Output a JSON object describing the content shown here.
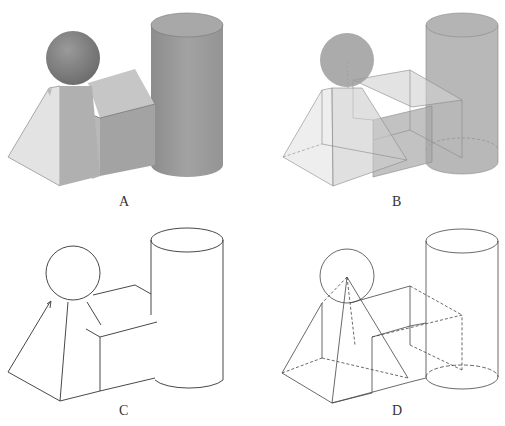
{
  "figure": {
    "panels": [
      {
        "id": "A",
        "label": "A",
        "mode": "shaded",
        "x": 0,
        "y": 0
      },
      {
        "id": "B",
        "label": "B",
        "mode": "transparent",
        "x": 250,
        "y": 0
      },
      {
        "id": "C",
        "label": "C",
        "mode": "hidden-line",
        "x": 0,
        "y": 215
      },
      {
        "id": "D",
        "label": "D",
        "mode": "wireframe",
        "x": 250,
        "y": 215
      }
    ],
    "colors": {
      "background": "#ffffff",
      "sphere": "#8a8a8a",
      "cylinder": "#9a9a9a",
      "block_front": "#a5a5a5",
      "block_top": "#c8c8c8",
      "pyramid_left": "#e2e2e2",
      "pyramid_front": "#b4b4b4",
      "edge": "#444444"
    }
  }
}
